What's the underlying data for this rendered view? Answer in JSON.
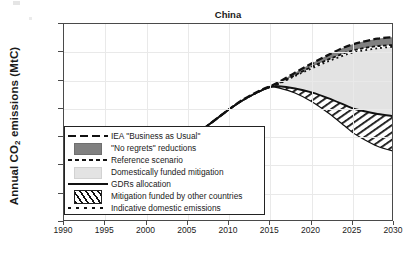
{
  "chart_data": {
    "type": "area",
    "title": "China",
    "xlabel": "",
    "ylabel": "Annual CO2 emissions (MtC)",
    "ylabel_prefix": "Annual CO",
    "ylabel_sub": "2",
    "ylabel_suffix": " emissions (MtC)",
    "xlim": [
      1990,
      2030
    ],
    "ylim": [
      0,
      3500
    ],
    "xticks": [
      1990,
      1995,
      2000,
      2005,
      2010,
      2015,
      2020,
      2025,
      2030
    ],
    "yticks": [
      0,
      500,
      1000,
      1500,
      2000,
      2500,
      3000,
      3500
    ],
    "grid": true,
    "legend_position": "lower-left-inside",
    "x": [
      1990,
      1995,
      2000,
      2005,
      2010,
      2012,
      2014,
      2015,
      2016,
      2018,
      2020,
      2022,
      2024,
      2025,
      2026,
      2028,
      2030
    ],
    "series": [
      {
        "name": "IEA \"Business as Usual\"",
        "style": "long-dash",
        "color": "#111111",
        "values": [
          580,
          780,
          1020,
          1450,
          1990,
          2190,
          2340,
          2400,
          2470,
          2640,
          2800,
          2950,
          3090,
          3140,
          3180,
          3240,
          3270
        ]
      },
      {
        "name": "Reference scenario",
        "style": "short-dash",
        "color": "#111111",
        "values": [
          580,
          780,
          1020,
          1450,
          1990,
          2180,
          2330,
          2385,
          2445,
          2595,
          2740,
          2870,
          2985,
          3030,
          3065,
          3110,
          3130
        ]
      },
      {
        "name": "Indicative domestic emissions",
        "style": "dotted",
        "color": "#111111",
        "values": [
          580,
          780,
          1020,
          1450,
          1990,
          2180,
          2330,
          2385,
          2440,
          2580,
          2715,
          2840,
          2950,
          2995,
          3025,
          3070,
          3100
        ]
      },
      {
        "name": "GDRs allocation",
        "style": "solid",
        "color": "#111111",
        "values": [
          580,
          780,
          1020,
          1450,
          1990,
          2180,
          2330,
          2390,
          2400,
          2360,
          2290,
          2190,
          2070,
          2010,
          1970,
          1910,
          1870
        ]
      },
      {
        "name": "Mitigation funded by other countries lower bound",
        "style": "solid-thin",
        "color": "#111111",
        "values": [
          580,
          780,
          1020,
          1450,
          1990,
          2180,
          2330,
          2385,
          2370,
          2280,
          2130,
          1930,
          1700,
          1580,
          1490,
          1340,
          1250
        ]
      }
    ],
    "bands": [
      {
        "name": "\"No regrets\" reductions",
        "fill": "#808080",
        "between": [
          "IEA \"Business as Usual\"",
          "Reference scenario"
        ]
      },
      {
        "name": "Domestically funded mitigation",
        "fill": "#e3e3e3",
        "between": [
          "Indicative domestic emissions",
          "GDRs allocation"
        ]
      },
      {
        "name": "Mitigation funded by other countries",
        "fill": "hatch",
        "between": [
          "GDRs allocation",
          "Mitigation funded by other countries lower bound"
        ]
      }
    ]
  },
  "legend": {
    "items": [
      {
        "key": "long-dash",
        "label": "IEA \"Business as Usual\""
      },
      {
        "key": "dark-swatch",
        "label": "\"No regrets\" reductions"
      },
      {
        "key": "short-dash",
        "label": "Reference scenario"
      },
      {
        "key": "light-swatch",
        "label": "Domestically funded mitigation"
      },
      {
        "key": "solid",
        "label": "GDRs allocation"
      },
      {
        "key": "hatch",
        "label": "Mitigation funded by other countries"
      },
      {
        "key": "dotted",
        "label": "Indicative domestic emissions"
      }
    ]
  },
  "colors": {
    "no_regrets_fill": "#808080",
    "domestic_fill": "#e3e3e3",
    "line": "#111111",
    "axis": "#4a4a4a",
    "grid": "#e9e9e9"
  }
}
